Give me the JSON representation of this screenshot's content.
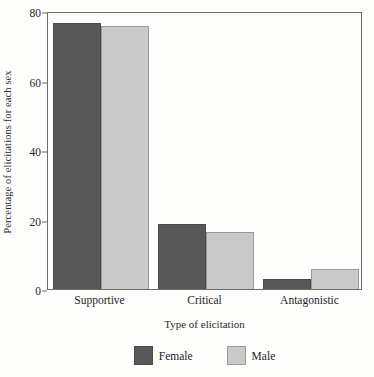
{
  "chart_data": {
    "type": "bar",
    "title": "",
    "categories": [
      "Supportive",
      "Critical",
      "Antagonistic"
    ],
    "series": [
      {
        "name": "Female",
        "color": "#585858",
        "values": [
          76.5,
          18.7,
          2.9
        ]
      },
      {
        "name": "Male",
        "color": "#c9c9c9",
        "values": [
          75.8,
          16.4,
          5.8
        ]
      }
    ],
    "xlabel": "Type of elicitation",
    "ylabel": "Percentage of elicitations for each sex",
    "ylim": [
      0,
      80
    ],
    "yticks": [
      0,
      20,
      40,
      60,
      80
    ],
    "ytick_labels": [
      "0",
      "20",
      "40",
      "60",
      "80"
    ],
    "grid": false,
    "legend_position": "bottom-center"
  },
  "axis": {
    "y_title": "Percentage of elicitations for each sex",
    "x_title": "Type of elicitation",
    "y_ticks": [
      "80",
      "60",
      "40",
      "20",
      "0"
    ],
    "x_ticks": [
      "Supportive",
      "Critical",
      "Antagonistic"
    ]
  },
  "legend": {
    "items": [
      {
        "label": "Female",
        "color": "#585858"
      },
      {
        "label": "Male",
        "color": "#c9c9c9"
      }
    ]
  }
}
